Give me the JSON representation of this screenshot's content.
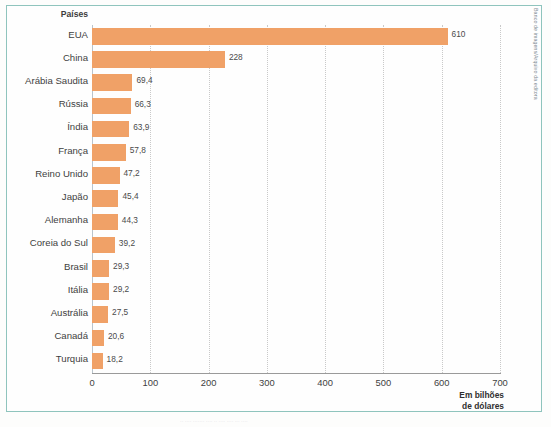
{
  "credit": {
    "text": "Banco de imagens/Arquivo da editora"
  },
  "chart_data": {
    "type": "bar",
    "orientation": "horizontal",
    "title": "",
    "subtitle": "",
    "xlabel": "Em bilhões de dólares",
    "ylabel": "Países",
    "categories": [
      "EUA",
      "China",
      "Arábia Saudita",
      "Rússia",
      "Índia",
      "França",
      "Reino Unido",
      "Japão",
      "Alemanha",
      "Coreia do Sul",
      "Brasil",
      "Itália",
      "Austrália",
      "Canadá",
      "Turquia"
    ],
    "values": [
      610,
      228,
      69.4,
      66.3,
      63.9,
      57.8,
      47.2,
      45.4,
      44.3,
      39.2,
      29.3,
      29.2,
      27.5,
      20.6,
      18.2
    ],
    "value_labels": [
      "610",
      "228",
      "69,4",
      "66,3",
      "63,9",
      "57,8",
      "47,2",
      "45,4",
      "44,3",
      "39,2",
      "29,3",
      "29,2",
      "27,5",
      "20,6",
      "18,2"
    ],
    "xlim": [
      0,
      700
    ],
    "xticks": [
      0,
      100,
      200,
      300,
      400,
      500,
      600,
      700
    ],
    "xtick_labels": [
      "0",
      "100",
      "200",
      "300",
      "400",
      "500",
      "600",
      "700"
    ],
    "grid": true,
    "grid_style": "dotted-vertical",
    "legend": null,
    "bar_color": "#f0a167",
    "frame_color": "#8fc4bd",
    "axis_color": "#9a9a9a",
    "label_color": "#3f3f3f"
  },
  "bottom_artifact": {
    "text": "·· ···· ······· ···· ·· ···· ···· ··· ····"
  }
}
